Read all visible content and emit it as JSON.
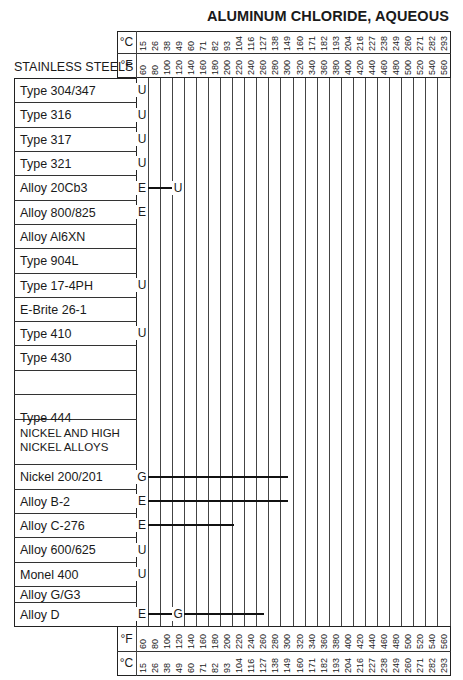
{
  "title": "ALUMINUM CHLORIDE, AQUEOUS",
  "units": {
    "celsius": "°C",
    "fahrenheit": "°F"
  },
  "section_headers": {
    "stainless": "STAINLESS STEELS",
    "nickel_line1": "NICKEL AND HIGH",
    "nickel_line2": "NICKEL ALLOYS"
  },
  "chart_data": {
    "type": "table",
    "title": "ALUMINUM CHLORIDE, AQUEOUS",
    "xlabel": "Temperature",
    "fahrenheit_ticks": [
      60,
      80,
      100,
      120,
      140,
      160,
      180,
      200,
      220,
      240,
      260,
      280,
      300,
      320,
      340,
      360,
      380,
      400,
      420,
      440,
      460,
      480,
      500,
      520,
      540,
      560
    ],
    "celsius_ticks": [
      15,
      26,
      38,
      49,
      60,
      71,
      82,
      93,
      104,
      116,
      127,
      138,
      149,
      160,
      171,
      182,
      193,
      204,
      216,
      227,
      238,
      249,
      260,
      271,
      282,
      293
    ],
    "legend_codes": [
      "E",
      "G",
      "U"
    ],
    "rows": [
      {
        "section": "STAINLESS STEELS",
        "material": "Type 304/347",
        "ratings": [
          {
            "code": "U",
            "at_F": 60
          }
        ]
      },
      {
        "section": "STAINLESS STEELS",
        "material": "Type 316",
        "ratings": [
          {
            "code": "U",
            "at_F": 60
          }
        ]
      },
      {
        "section": "STAINLESS STEELS",
        "material": "Type 317",
        "ratings": [
          {
            "code": "U",
            "at_F": 60
          }
        ]
      },
      {
        "section": "STAINLESS STEELS",
        "material": "Type 321",
        "ratings": [
          {
            "code": "U",
            "at_F": 60
          }
        ]
      },
      {
        "section": "STAINLESS STEELS",
        "material": "Alloy 20Cb3",
        "ratings": [
          {
            "code": "E",
            "from_F": 60,
            "to_F": 120
          },
          {
            "code": "U",
            "at_F": 120
          }
        ]
      },
      {
        "section": "STAINLESS STEELS",
        "material": "Alloy 800/825",
        "ratings": [
          {
            "code": "E",
            "at_F": 60
          }
        ]
      },
      {
        "section": "STAINLESS STEELS",
        "material": "Alloy Al6XN",
        "ratings": []
      },
      {
        "section": "STAINLESS STEELS",
        "material": "Type 904L",
        "ratings": []
      },
      {
        "section": "STAINLESS STEELS",
        "material": "Type 17-4PH",
        "ratings": [
          {
            "code": "U",
            "at_F": 60
          }
        ]
      },
      {
        "section": "STAINLESS STEELS",
        "material": "E-Brite 26-1",
        "ratings": []
      },
      {
        "section": "STAINLESS STEELS",
        "material": "Type 410",
        "ratings": [
          {
            "code": "U",
            "at_F": 60
          }
        ]
      },
      {
        "section": "STAINLESS STEELS",
        "material": "Type 430",
        "ratings": []
      },
      {
        "section": "STAINLESS STEELS",
        "material": "Type 444",
        "ratings": []
      },
      {
        "section": "NICKEL AND HIGH NICKEL ALLOYS",
        "material": "Nickel 200/201",
        "ratings": [
          {
            "code": "G",
            "from_F": 60,
            "to_F": 300
          }
        ]
      },
      {
        "section": "NICKEL AND HIGH NICKEL ALLOYS",
        "material": "Alloy B-2",
        "ratings": [
          {
            "code": "E",
            "from_F": 60,
            "to_F": 300
          }
        ]
      },
      {
        "section": "NICKEL AND HIGH NICKEL ALLOYS",
        "material": "Alloy C-276",
        "ratings": [
          {
            "code": "E",
            "from_F": 60,
            "to_F": 210
          }
        ]
      },
      {
        "section": "NICKEL AND HIGH NICKEL ALLOYS",
        "material": "Alloy 600/625",
        "ratings": [
          {
            "code": "U",
            "at_F": 60
          }
        ]
      },
      {
        "section": "NICKEL AND HIGH NICKEL ALLOYS",
        "material": "Monel 400",
        "ratings": [
          {
            "code": "U",
            "at_F": 60
          }
        ]
      },
      {
        "section": "NICKEL AND HIGH NICKEL ALLOYS",
        "material": "Alloy G/G3",
        "ratings": []
      },
      {
        "section": "NICKEL AND HIGH NICKEL ALLOYS",
        "material": "Alloy D",
        "ratings": [
          {
            "code": "E",
            "from_F": 60,
            "to_F": 120
          },
          {
            "code": "G",
            "from_F": 120,
            "to_F": 260
          }
        ]
      }
    ]
  },
  "table": {
    "rows": [
      {
        "label": "Type 304/347",
        "top": 78
      },
      {
        "label": "Type 316",
        "top": 102
      },
      {
        "label": "Type 317",
        "top": 127
      },
      {
        "label": "Type 321",
        "top": 151
      },
      {
        "label": "Alloy 20Cb3",
        "top": 175
      },
      {
        "label": "Alloy 800/825",
        "top": 200
      },
      {
        "label": "Alloy Al6XN",
        "top": 224
      },
      {
        "label": "Type 904L",
        "top": 248
      },
      {
        "label": "Type 17-4PH",
        "top": 273
      },
      {
        "label": "E-Brite 26-1",
        "top": 297
      },
      {
        "label": "Type 410",
        "top": 321
      },
      {
        "label": "Type 430",
        "top": 345
      },
      {
        "label": "Type 444",
        "top": 370
      },
      {
        "label": "",
        "top": 394
      },
      {
        "label": "Nickel 200/201",
        "top": 464
      },
      {
        "label": "Alloy B-2",
        "top": 489
      },
      {
        "label": "Alloy C-276",
        "top": 513
      },
      {
        "label": "Alloy 600/625",
        "top": 537
      },
      {
        "label": "Monel 400",
        "top": 562
      },
      {
        "label": "Alloy G/G3",
        "top": 586
      },
      {
        "label": "Alloy D",
        "top": 602
      }
    ]
  }
}
